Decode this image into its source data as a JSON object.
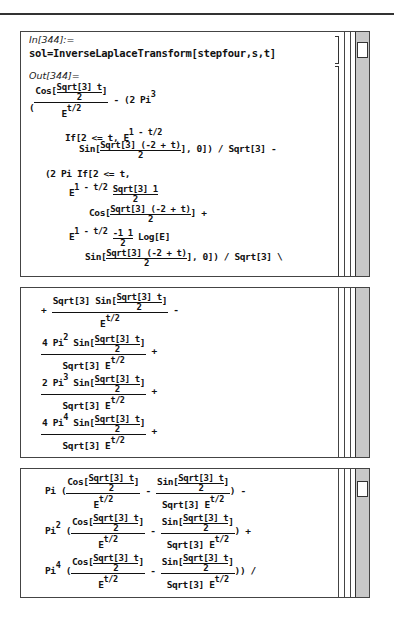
{
  "notebook": {
    "cell_in_label": "In[344]:=",
    "cell_in_code": "sol=InverseLaplaceTransform[stepfour,s,t]",
    "cell_out_label": "Out[344]=",
    "panel1": {
      "l1_cos": "Cos[",
      "l1_num": "Sqrt[3] t",
      "l1_den": "2",
      "l1_close": "]",
      "l1_open": "(",
      "l1_denE": "E",
      "l1_denExp": "t/2",
      "l1_rest": "- (2 Pi",
      "l1_sup": "3",
      "l2": "If[2 <= t, E",
      "l2_sup": "1 - t/2",
      "l3_pre": "Sin[",
      "l3_num": "Sqrt[3] (-2 + t)",
      "l3_den": "2",
      "l3_post": "], 0]) / Sqrt[3] -",
      "l4": "(2 Pi If[2 <= t,",
      "l5_pre": "E",
      "l5_sup": "1 - t/2",
      "l5_num": "Sqrt[3] 1",
      "l5_den": "2",
      "l6_pre": "Cos[",
      "l6_num": "Sqrt[3] (-2 + t)",
      "l6_den": "2",
      "l6_post": "] +",
      "l7_pre": "E",
      "l7_sup": "1 - t/2",
      "l7_num": "-1 1",
      "l7_den": "2",
      "l7_post": "Log[E]",
      "l8_pre": "Sin[",
      "l8_num": "Sqrt[3] (-2 + t)",
      "l8_den": "2",
      "l8_post": "], 0]) / Sqrt[3] \\"
    },
    "panel2": {
      "t1_sign": "+",
      "t1_num_pre": "Sqrt[3] Sin[",
      "t1_num_frac_n": "Sqrt[3] t",
      "t1_num_frac_d": "2",
      "t1_num_post": "]",
      "t1_den": "E",
      "t1_den_sup": "t/2",
      "t1_after": "-",
      "t2_num_pre": "4 Pi",
      "t2_sup": "2",
      "t2_num_mid": "Sin[",
      "t2_frac_n": "Sqrt[3] t",
      "t2_frac_d": "2",
      "t2_num_post": "]",
      "t2_den": "Sqrt[3] E",
      "t2_den_sup": "t/2",
      "t2_after": "+",
      "t3_num_pre": "2 Pi",
      "t3_sup": "3",
      "t3_num_mid": "Sin[",
      "t3_frac_n": "Sqrt[3] t",
      "t3_frac_d": "2",
      "t3_num_post": "]",
      "t3_den": "Sqrt[3] E",
      "t3_den_sup": "t/2",
      "t3_after": "+",
      "t4_num_pre": "4 Pi",
      "t4_sup": "4",
      "t4_num_mid": "Sin[",
      "t4_frac_n": "Sqrt[3] t",
      "t4_frac_d": "2",
      "t4_num_post": "]",
      "t4_den": "Sqrt[3] E",
      "t4_den_sup": "t/2",
      "t4_after": "+"
    },
    "panel3": {
      "rows": [
        {
          "pre": "Pi",
          "sup": "",
          "after": ") -"
        },
        {
          "pre": "Pi",
          "sup": "2",
          "after": ") +"
        },
        {
          "pre": "Pi",
          "sup": "4",
          "after": ")) /"
        }
      ],
      "open": "(",
      "cos_pre": "Cos[",
      "sin_pre": "Sin[",
      "frac_n": "Sqrt[3] t",
      "frac_d": "2",
      "close": "]",
      "den1": "E",
      "den2": "Sqrt[3] E",
      "den_sup": "t/2",
      "minus": "-"
    }
  }
}
